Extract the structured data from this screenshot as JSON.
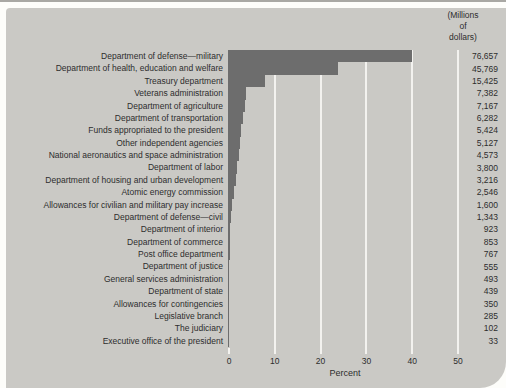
{
  "panel": {
    "background_color": "#cac9c5",
    "bar_color": "#6d6d6d",
    "gridline_color": "#f3f2ef",
    "text_color": "#2d2d2d"
  },
  "unit_header": {
    "lines": [
      "(Millions",
      "of",
      "dollars)"
    ]
  },
  "chart_data": {
    "type": "bar",
    "orientation": "horizontal",
    "title": "",
    "xlabel": "Percent",
    "ylabel": "",
    "x_ticks": [
      0,
      10,
      20,
      30,
      40,
      50
    ],
    "xlim": [
      0,
      52
    ],
    "grid": true,
    "unit": "Millions of dollars",
    "total": 191111,
    "categories": [
      "Department of defense—military",
      "Department of health, education and welfare",
      "Treasury department",
      "Veterans administration",
      "Department of agriculture",
      "Department of transportation",
      "Funds appropriated to the president",
      "Other independent agencies",
      "National aeronautics and space administration",
      "Department of labor",
      "Department of housing and urban development",
      "Atomic energy commission",
      "Allowances for civilian and military pay increase",
      "Department of defense—civil",
      "Department of interior",
      "Department of commerce",
      "Post office department",
      "Department of justice",
      "General services administration",
      "Department of state",
      "Allowances for contingencies",
      "Legislative branch",
      "The judiciary",
      "Executive office of the president"
    ],
    "values": [
      76657,
      45769,
      15425,
      7382,
      7167,
      6282,
      5424,
      5127,
      4573,
      3800,
      3216,
      2546,
      1600,
      1343,
      923,
      853,
      767,
      555,
      493,
      439,
      350,
      285,
      102,
      33
    ],
    "value_labels": [
      "76,657",
      "45,769",
      "15,425",
      "7,382",
      "7,167",
      "6,282",
      "5,424",
      "5,127",
      "4,573",
      "3,800",
      "3,216",
      "2,546",
      "1,600",
      "1,343",
      "923",
      "853",
      "767",
      "555",
      "493",
      "439",
      "350",
      "285",
      "102",
      "33"
    ],
    "percents": [
      40.11,
      23.95,
      8.07,
      3.86,
      3.75,
      3.29,
      2.84,
      2.68,
      2.39,
      1.99,
      1.68,
      1.33,
      0.84,
      0.7,
      0.48,
      0.45,
      0.4,
      0.29,
      0.26,
      0.23,
      0.18,
      0.15,
      0.05,
      0.02
    ]
  }
}
